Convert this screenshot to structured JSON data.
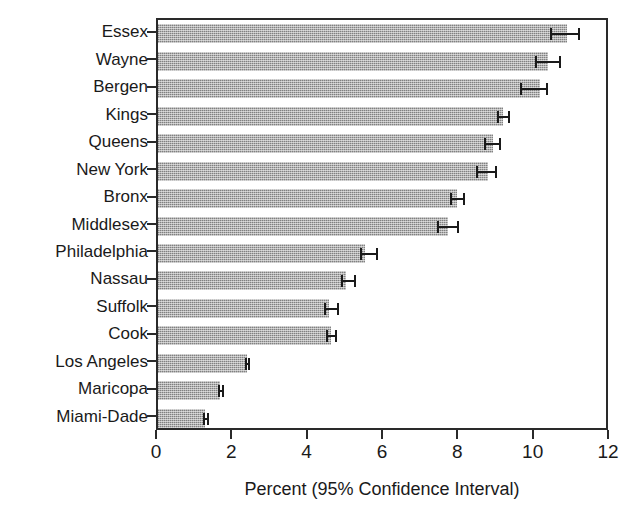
{
  "chart_data": {
    "type": "bar",
    "orientation": "horizontal",
    "title": "",
    "xlabel": "Percent (95% Confidence Interval)",
    "ylabel": "",
    "xlim": [
      0,
      12
    ],
    "xticks": [
      0,
      2,
      4,
      6,
      8,
      10,
      12
    ],
    "xticklabels": [
      "0",
      "2",
      "4",
      "6",
      "8",
      "10",
      "12"
    ],
    "grid": false,
    "legend": null,
    "bar_color": "#b0b0b0",
    "errorbar_color": "#1a1a1a",
    "axis_color": "#2a2a2a",
    "categories": [
      "Essex",
      "Wayne",
      "Bergen",
      "Kings",
      "Queens",
      "New York",
      "Bronx",
      "Middlesex",
      "Philadelphia",
      "Nassau",
      "Suffolk",
      "Cook",
      "Los Angeles",
      "Maricopa",
      "Miami-Dade"
    ],
    "values": [
      10.85,
      10.35,
      10.15,
      9.15,
      8.9,
      8.75,
      7.95,
      7.7,
      5.5,
      5.0,
      4.55,
      4.6,
      2.35,
      1.65,
      1.25
    ],
    "ci_lower": [
      10.4,
      10.0,
      9.6,
      9.0,
      8.65,
      8.45,
      7.75,
      7.4,
      5.35,
      4.85,
      4.4,
      4.45,
      2.3,
      1.6,
      1.2
    ],
    "ci_upper": [
      11.2,
      10.7,
      10.35,
      9.35,
      9.1,
      9.0,
      8.15,
      8.0,
      5.85,
      5.25,
      4.8,
      4.75,
      2.45,
      1.75,
      1.35
    ]
  }
}
